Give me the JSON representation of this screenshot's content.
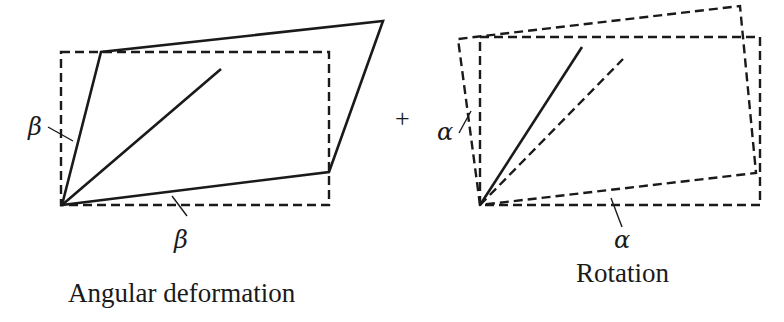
{
  "diagram": {
    "left_panel": {
      "caption": "Angular deformation",
      "angle_symbol_left": "β",
      "angle_symbol_bottom": "β",
      "original_shape": "dashed rectangle",
      "deformed_shape": "solid parallelogram",
      "diagonal": "solid"
    },
    "operator": "+",
    "right_panel": {
      "caption": "Rotation",
      "angle_symbol_left": "α",
      "angle_symbol_bottom": "α",
      "original_shape": "dashed rectangle",
      "rotated_shape": "dashed rotated rectangle",
      "diagonal_rotated": "solid",
      "diagonal_original": "dashed"
    }
  }
}
